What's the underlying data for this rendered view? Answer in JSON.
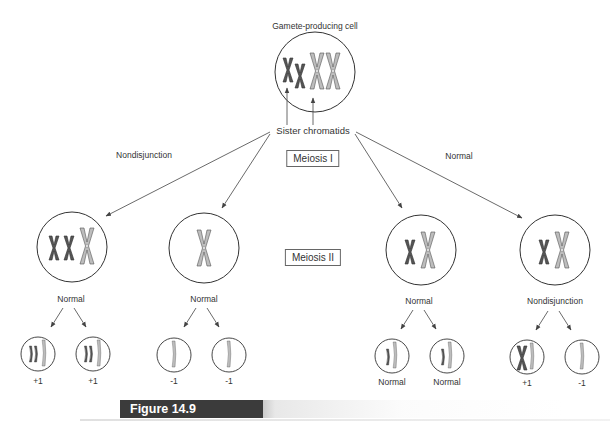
{
  "figure": {
    "label": "Figure 14.9",
    "title": "Gamete-producing cell",
    "pointer_label": "Sister chromatids",
    "stage_labels": {
      "meiosis1": "Meiosis I",
      "meiosis2": "Meiosis II"
    },
    "branch_labels": {
      "left": "Nondisjunction",
      "right": "Normal"
    },
    "second_division_labels": [
      "Normal",
      "Normal",
      "Normal",
      "Nondisjunction"
    ],
    "gamete_labels": [
      "+1",
      "+1",
      "-1",
      "-1",
      "Normal",
      "Normal",
      "+1",
      "-1"
    ]
  },
  "colors": {
    "dark_chromosome": "#555555",
    "light_chromosome": "#b5b5b5",
    "outline": "#333333",
    "arrow": "#444444"
  }
}
